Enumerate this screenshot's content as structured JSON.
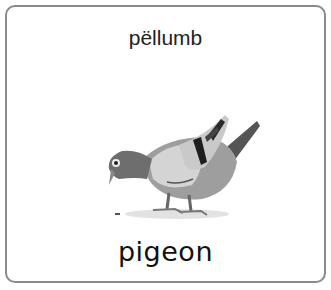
{
  "card": {
    "native_word": "pëllumb",
    "english_word": "pigeon",
    "image": {
      "subject": "pigeon-illustration",
      "colors": {
        "body": "#b8b8b8",
        "head": "#6e6e6e",
        "wing_bars": "#1e1e1e",
        "shadow": "#dcdcdc"
      }
    },
    "border_color": "#8a8a8a"
  }
}
